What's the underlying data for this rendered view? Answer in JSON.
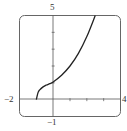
{
  "chart_data": {
    "type": "line",
    "title": "",
    "xlabel": "",
    "ylabel": "",
    "xlim": [
      -2,
      4
    ],
    "ylim": [
      -1,
      5
    ],
    "grid": false,
    "x_ticks": [
      1,
      2,
      3
    ],
    "y_ticks": [
      1,
      2,
      3,
      4
    ],
    "tick_labels": {
      "xmin": "−2",
      "xmax": "4",
      "ymin": "−1",
      "ymax": "5"
    },
    "series": [
      {
        "name": "f(x)",
        "x": [
          -1,
          -0.9,
          -0.8,
          -0.6,
          -0.4,
          -0.2,
          0,
          0.5,
          1,
          1.5,
          2,
          2.5
        ],
        "y": [
          0,
          0.42,
          0.58,
          0.76,
          0.87,
          0.95,
          1.05,
          1.45,
          2.0,
          2.75,
          3.75,
          5.0
        ]
      }
    ]
  },
  "colors": {
    "axis": "#555555",
    "frame": "#666666",
    "curve": "#222222"
  }
}
